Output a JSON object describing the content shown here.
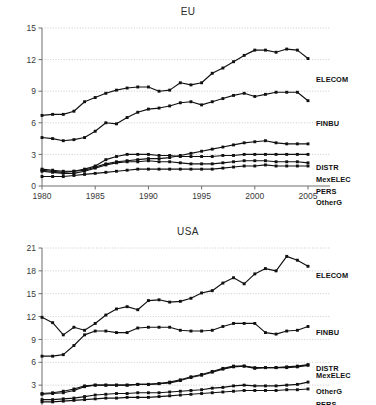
{
  "chart_data": [
    {
      "type": "line",
      "title": "EU",
      "xlabel": "",
      "ylabel": "",
      "xlim": [
        1980,
        2005
      ],
      "ylim": [
        0,
        15
      ],
      "xticks": [
        1980,
        1985,
        1990,
        1995,
        2000,
        2005
      ],
      "yticks": [
        0,
        3,
        6,
        9,
        12,
        15
      ],
      "grid": "horizontal-dotted",
      "legend_position": "right-of-plot-inline",
      "marker": "filled-square",
      "line_color": "#111111",
      "x": [
        1980,
        1981,
        1982,
        1983,
        1984,
        1985,
        1986,
        1987,
        1988,
        1989,
        1990,
        1991,
        1992,
        1993,
        1994,
        1995,
        1996,
        1997,
        1998,
        1999,
        2000,
        2001,
        2002,
        2003,
        2004,
        2005
      ],
      "series": [
        {
          "name": "ELECOM",
          "values": [
            6.7,
            6.8,
            6.8,
            7.1,
            8.0,
            8.4,
            8.8,
            9.1,
            9.3,
            9.4,
            9.4,
            9.0,
            9.1,
            9.8,
            9.6,
            9.8,
            10.7,
            11.2,
            11.8,
            12.4,
            12.9,
            12.9,
            12.7,
            13.0,
            12.9,
            12.1
          ]
        },
        {
          "name": "FINBU",
          "values": [
            4.6,
            4.5,
            4.3,
            4.4,
            4.6,
            5.2,
            6.0,
            5.9,
            6.5,
            7.0,
            7.3,
            7.4,
            7.6,
            7.9,
            8.0,
            7.7,
            8.0,
            8.3,
            8.6,
            8.8,
            8.5,
            8.7,
            8.9,
            8.9,
            8.9,
            8.1
          ]
        },
        {
          "name": "DISTR",
          "values": [
            1.6,
            1.5,
            1.4,
            1.4,
            1.5,
            1.8,
            2.1,
            2.3,
            2.4,
            2.5,
            2.6,
            2.6,
            2.7,
            2.9,
            3.1,
            3.3,
            3.5,
            3.7,
            3.9,
            4.1,
            4.2,
            4.3,
            4.1,
            4.0,
            4.0,
            4.0
          ]
        },
        {
          "name": "MexELEC",
          "values": [
            1.5,
            1.4,
            1.3,
            1.4,
            1.6,
            1.9,
            2.5,
            2.8,
            3.0,
            3.0,
            3.0,
            2.9,
            2.9,
            2.8,
            2.8,
            2.8,
            2.8,
            2.9,
            2.9,
            3.0,
            3.0,
            3.0,
            3.0,
            3.0,
            3.0,
            3.0
          ]
        },
        {
          "name": "PERS",
          "values": [
            1.4,
            1.3,
            1.2,
            1.2,
            1.4,
            1.7,
            2.0,
            2.2,
            2.3,
            2.3,
            2.4,
            2.3,
            2.3,
            2.2,
            2.1,
            2.1,
            2.1,
            2.2,
            2.3,
            2.4,
            2.4,
            2.4,
            2.3,
            2.3,
            2.3,
            2.2
          ]
        },
        {
          "name": "OtherG",
          "values": [
            0.9,
            0.9,
            0.9,
            1.0,
            1.1,
            1.2,
            1.3,
            1.4,
            1.5,
            1.6,
            1.6,
            1.6,
            1.6,
            1.6,
            1.6,
            1.6,
            1.6,
            1.7,
            1.8,
            1.9,
            1.9,
            2.0,
            1.9,
            1.9,
            1.9,
            1.9
          ]
        }
      ]
    },
    {
      "type": "line",
      "title": "USA",
      "xlabel": "",
      "ylabel": "",
      "xlim": [
        1980,
        2005
      ],
      "ylim": [
        0,
        21
      ],
      "xticks": [
        1980,
        1985,
        1990,
        1995,
        2000,
        2005
      ],
      "yticks": [
        0,
        3,
        6,
        9,
        12,
        15,
        18,
        21
      ],
      "grid": "horizontal-dotted",
      "legend_position": "right-of-plot-inline",
      "marker": "filled-square",
      "line_color": "#111111",
      "note": "lower portion of plot is cropped by the image edge",
      "x": [
        1980,
        1981,
        1982,
        1983,
        1984,
        1985,
        1986,
        1987,
        1988,
        1989,
        1990,
        1991,
        1992,
        1993,
        1994,
        1995,
        1996,
        1997,
        1998,
        1999,
        2000,
        2001,
        2002,
        2003,
        2004,
        2005
      ],
      "series": [
        {
          "name": "ELECOM",
          "values": [
            11.9,
            11.2,
            9.6,
            10.6,
            10.2,
            11.1,
            12.2,
            13.0,
            13.3,
            12.9,
            14.1,
            14.2,
            13.9,
            14.0,
            14.4,
            15.1,
            15.4,
            16.4,
            17.1,
            16.3,
            17.6,
            18.3,
            18.0,
            19.9,
            19.4,
            18.6
          ]
        },
        {
          "name": "FINBU",
          "values": [
            6.8,
            6.8,
            7.0,
            8.2,
            9.6,
            10.1,
            10.1,
            9.9,
            9.9,
            10.5,
            10.6,
            10.6,
            10.6,
            10.2,
            10.1,
            10.1,
            10.2,
            10.7,
            11.1,
            11.1,
            11.1,
            9.9,
            9.7,
            10.1,
            10.2,
            10.7
          ]
        },
        {
          "name": "DISTR",
          "values": [
            1.8,
            1.9,
            2.0,
            2.3,
            2.8,
            3.0,
            3.0,
            3.0,
            3.0,
            3.1,
            3.1,
            3.2,
            3.4,
            3.7,
            4.1,
            4.4,
            4.8,
            5.2,
            5.5,
            5.5,
            5.3,
            5.3,
            5.3,
            5.4,
            5.5,
            5.7
          ]
        },
        {
          "name": "MexELEC",
          "values": [
            1.9,
            2.0,
            2.2,
            2.5,
            2.9,
            3.0,
            3.0,
            3.0,
            3.0,
            3.1,
            3.1,
            3.2,
            3.3,
            3.6,
            4.0,
            4.3,
            4.7,
            5.1,
            5.4,
            5.5,
            5.2,
            5.3,
            5.3,
            5.3,
            5.4,
            5.6
          ]
        },
        {
          "name": "OtherG",
          "values": [
            1.1,
            1.1,
            1.2,
            1.3,
            1.5,
            1.7,
            1.8,
            1.9,
            1.9,
            2.0,
            2.0,
            2.0,
            2.1,
            2.2,
            2.3,
            2.4,
            2.6,
            2.7,
            2.9,
            3.0,
            2.9,
            2.9,
            2.9,
            3.0,
            3.1,
            3.4
          ]
        },
        {
          "name": "PERS",
          "values": [
            0.8,
            0.8,
            0.9,
            1.0,
            1.1,
            1.2,
            1.3,
            1.3,
            1.4,
            1.4,
            1.4,
            1.5,
            1.6,
            1.7,
            1.8,
            1.9,
            2.0,
            2.1,
            2.2,
            2.3,
            2.3,
            2.3,
            2.3,
            2.4,
            2.4,
            2.5
          ]
        }
      ]
    }
  ]
}
